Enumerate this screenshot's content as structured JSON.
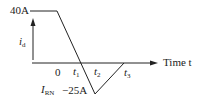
{
  "diagram": {
    "title": "",
    "waveform": "reverse recovery current of diode i_d versus time",
    "labels": {
      "peak_current": "40A",
      "y_axis_symbol": "i",
      "y_axis_subscript": "d",
      "origin": "0",
      "x_axis_label": "Time t",
      "t1_symbol": "t",
      "t1_subscript": "1",
      "t2_symbol": "t",
      "t2_subscript": "2",
      "t3_symbol": "t",
      "t3_subscript": "3",
      "irn_symbol": "I",
      "irn_subscript": "RN",
      "reverse_peak_current": "−25A"
    },
    "points": [
      {
        "t": "start",
        "i_A": 40
      },
      {
        "t": "0",
        "i_A": 40
      },
      {
        "t": "t1",
        "i_A": 0
      },
      {
        "t": "t2",
        "i_A": -25
      },
      {
        "t": "t3",
        "i_A": 0
      }
    ],
    "colors": {
      "line": "#222222",
      "background": "#ffffff"
    }
  }
}
